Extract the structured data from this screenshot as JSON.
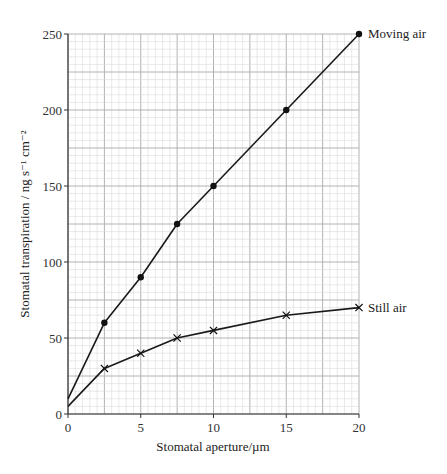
{
  "chart_data": {
    "type": "line",
    "title": "",
    "xlabel": "Stomatal aperture/µm",
    "ylabel": "Stomatal transpiration / ng s⁻¹ cm⁻²",
    "xlim": [
      0,
      20
    ],
    "ylim": [
      0,
      250
    ],
    "xticks": [
      0,
      5,
      10,
      15,
      20
    ],
    "yticks": [
      0,
      50,
      100,
      150,
      200,
      250
    ],
    "grid": true,
    "legend_position": "inline-right",
    "series": [
      {
        "name": "Moving air",
        "marker": "dot",
        "x": [
          0,
          2.5,
          5,
          7.5,
          10,
          15,
          20
        ],
        "y": [
          10,
          60,
          90,
          125,
          150,
          200,
          250
        ],
        "marked_points": [
          false,
          true,
          true,
          true,
          true,
          true,
          true
        ]
      },
      {
        "name": "Still air",
        "marker": "cross",
        "x": [
          0,
          2.5,
          5,
          7.5,
          10,
          15,
          20
        ],
        "y": [
          5,
          30,
          40,
          50,
          55,
          65,
          70
        ],
        "marked_points": [
          false,
          true,
          true,
          true,
          true,
          true,
          true
        ]
      }
    ]
  }
}
